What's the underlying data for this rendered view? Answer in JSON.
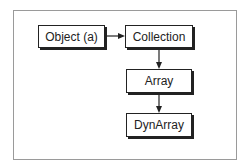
{
  "diagram": {
    "nodes": [
      {
        "id": "object",
        "label": "Object (a)"
      },
      {
        "id": "collection",
        "label": "Collection"
      },
      {
        "id": "array",
        "label": "Array"
      },
      {
        "id": "dynarray",
        "label": "DynArray"
      }
    ],
    "edges": [
      {
        "from": "object",
        "to": "collection"
      },
      {
        "from": "collection",
        "to": "array"
      },
      {
        "from": "array",
        "to": "dynarray"
      }
    ]
  }
}
